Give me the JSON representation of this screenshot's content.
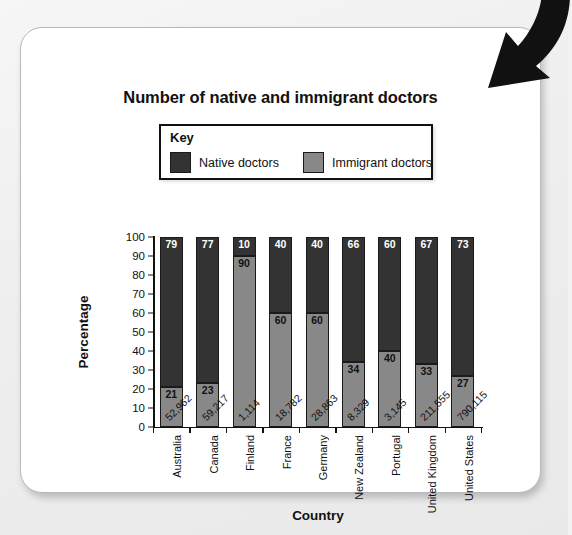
{
  "card": {
    "arrow_icon": "curved-arrow-down-left"
  },
  "chart_data": {
    "type": "bar",
    "subtype": "stacked-percentage",
    "title": "Number of native and immigrant doctors",
    "xlabel": "Country",
    "ylabel": "Percentage",
    "ylim": [
      0,
      100
    ],
    "ytick_step": 10,
    "yticks": [
      "0",
      "10",
      "20",
      "30",
      "40",
      "50",
      "60",
      "70",
      "80",
      "90",
      "100"
    ],
    "grid": false,
    "legend": {
      "title": "Key",
      "position": "above-plot",
      "entries": [
        {
          "name": "Native doctors",
          "color": "#333333"
        },
        {
          "name": "Immigrant doctors",
          "color": "#888888"
        }
      ]
    },
    "categories": [
      "Australia",
      "Canada",
      "Finland",
      "France",
      "Germany",
      "New Zealand",
      "Portugal",
      "United Kingdom",
      "United States"
    ],
    "totals_labels": [
      "52,962",
      "59,217",
      "1,114",
      "18,782",
      "28,863",
      "8,329",
      "3,145",
      "211,555",
      "790,115"
    ],
    "totals": [
      52962,
      59217,
      1114,
      18782,
      28863,
      8329,
      3145,
      211555,
      790115
    ],
    "series": [
      {
        "name": "Immigrant doctors",
        "color": "#888888",
        "values": [
          21,
          23,
          90,
          60,
          60,
          34,
          40,
          33,
          27
        ]
      },
      {
        "name": "Native doctors",
        "color": "#333333",
        "values": [
          79,
          77,
          10,
          40,
          40,
          66,
          60,
          67,
          73
        ]
      }
    ]
  }
}
